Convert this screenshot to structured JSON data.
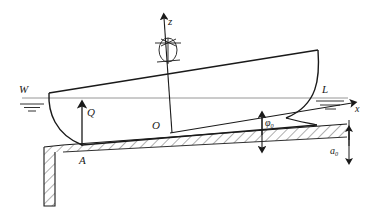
{
  "figure": {
    "type": "engineering-diagram",
    "colors": {
      "line": "#1a1a1a",
      "waterline": "#8a8a8a",
      "hatch": "#1a1a1a",
      "background": "#ffffff"
    }
  },
  "labels": {
    "z_axis": "z",
    "x_axis": "x",
    "origin": "O",
    "waterline_left": "W",
    "waterline_right": "L",
    "reaction_force": "Q",
    "contact_point": "A",
    "trim_angle": "φ",
    "trim_angle_sub": "0",
    "ground_depth": "a",
    "ground_depth_sub": "0"
  },
  "elements": {
    "hull_deck_line": "inclined deck line from stern to bow",
    "hull_stern_curve": "curved stern profile at left",
    "hull_bow_curve": "curved bow stem at right",
    "keel_line": "inclined keel / bottom line resting on seabed",
    "waterline": "horizontal W-L free surface line",
    "seabed": "hatched sloping seabed band",
    "quay_wall": "vertical hatched wall at left",
    "rotation_symbol": "ellipse with crossed lines on z-axis (centre of gravity / rotation marker)",
    "q_arrow": "upward force arrow at contact point A",
    "phi_arrow": "vertical double headed dimension arrow for trim offset",
    "a0_arrow": "vertical double headed dimension arrow for ground depth"
  }
}
